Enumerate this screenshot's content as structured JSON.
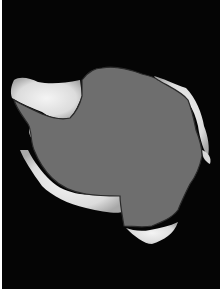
{
  "map": {
    "subject": "Antarctica sea ice extent",
    "colors": {
      "ocean": "#050505",
      "continent": "#6e6e6e",
      "continent_outline": "#2a2a2a",
      "sea_ice_bright": "#f4f4f4",
      "sea_ice_mid": "#c8c8c8",
      "frame": "#ffffff"
    }
  }
}
